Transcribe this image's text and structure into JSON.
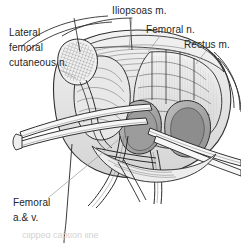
{
  "figure": {
    "style": "pen-and-ink medical illustration",
    "colors": {
      "background": "#ffffff",
      "ink": "#2b2b2b",
      "label_text": "#242424",
      "leader_line": "#8a8a8a",
      "shade_light": "#e9e9e9",
      "shade_mid": "#cfcfcf",
      "shade_dark": "#a8a8a8"
    }
  },
  "labels": {
    "lateral_femoral_cutaneous_nerve": "Lateral\nfemoral\ncutaneous n.",
    "iliopsoas": "Iliopsoas m.",
    "femoral_nerve": "Femoral n.",
    "rectus": "Rectus m.",
    "femoral_vessels": "Femoral\na.& v."
  },
  "caption": {
    "partial_text": "clipped caption line"
  }
}
